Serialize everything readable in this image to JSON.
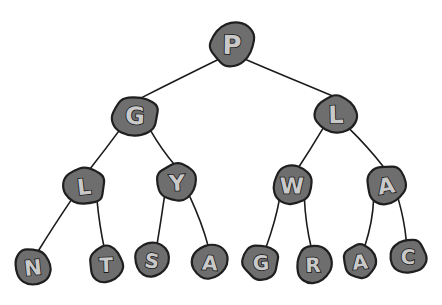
{
  "figure": {
    "title": "",
    "type": "binary-tree-diagram",
    "background_color": "#ffffff",
    "node_fill_color": "#6e6e6e",
    "node_outline_color": "#1f1f1f",
    "label_fill_color": "#c9c9c9",
    "label_outline_color": "#141414",
    "edge_color": "#1c1c1c",
    "width": 442,
    "height": 305
  },
  "tree": {
    "root": "P",
    "levels": 4,
    "node_count": 15,
    "nodes": [
      {
        "id": "n0",
        "label": "P",
        "level": 0,
        "x": 232,
        "y": 44,
        "rx": 23,
        "ry": 22,
        "font_size": 26,
        "shape": "blob-a"
      },
      {
        "id": "n1",
        "label": "G",
        "level": 1,
        "x": 135,
        "y": 115,
        "rx": 24,
        "ry": 20,
        "font_size": 24,
        "shape": "blob-b"
      },
      {
        "id": "n2",
        "label": "L",
        "level": 1,
        "x": 336,
        "y": 114,
        "rx": 21,
        "ry": 20,
        "font_size": 24,
        "shape": "blob-c"
      },
      {
        "id": "n3",
        "label": "L",
        "level": 2,
        "x": 84,
        "y": 186,
        "rx": 21,
        "ry": 20,
        "font_size": 22,
        "shape": "blob-d"
      },
      {
        "id": "n4",
        "label": "Y",
        "level": 2,
        "x": 177,
        "y": 182,
        "rx": 20,
        "ry": 19,
        "font_size": 22,
        "shape": "blob-a"
      },
      {
        "id": "n5",
        "label": "W",
        "level": 2,
        "x": 292,
        "y": 185,
        "rx": 20,
        "ry": 19,
        "font_size": 22,
        "shape": "blob-b"
      },
      {
        "id": "n6",
        "label": "A",
        "level": 2,
        "x": 386,
        "y": 185,
        "rx": 20,
        "ry": 20,
        "font_size": 22,
        "shape": "blob-c"
      },
      {
        "id": "n7",
        "label": "N",
        "level": 3,
        "x": 33,
        "y": 267,
        "rx": 19,
        "ry": 19,
        "font_size": 21,
        "shape": "blob-d"
      },
      {
        "id": "n8",
        "label": "T",
        "level": 3,
        "x": 106,
        "y": 264,
        "rx": 17,
        "ry": 18,
        "font_size": 20,
        "shape": "blob-a"
      },
      {
        "id": "n9",
        "label": "S",
        "level": 3,
        "x": 152,
        "y": 260,
        "rx": 17,
        "ry": 18,
        "font_size": 20,
        "shape": "blob-b"
      },
      {
        "id": "n10",
        "label": "A",
        "level": 3,
        "x": 210,
        "y": 262,
        "rx": 18,
        "ry": 18,
        "font_size": 20,
        "shape": "blob-c"
      },
      {
        "id": "n11",
        "label": "G",
        "level": 3,
        "x": 261,
        "y": 262,
        "rx": 18,
        "ry": 18,
        "font_size": 20,
        "shape": "blob-d"
      },
      {
        "id": "n12",
        "label": "R",
        "level": 3,
        "x": 313,
        "y": 264,
        "rx": 18,
        "ry": 19,
        "font_size": 20,
        "shape": "blob-a"
      },
      {
        "id": "n13",
        "label": "A",
        "level": 3,
        "x": 360,
        "y": 261,
        "rx": 17,
        "ry": 18,
        "font_size": 20,
        "shape": "blob-b"
      },
      {
        "id": "n14",
        "label": "C",
        "level": 3,
        "x": 408,
        "y": 256,
        "rx": 18,
        "ry": 18,
        "font_size": 20,
        "shape": "blob-c"
      }
    ],
    "edges": [
      {
        "from": "n0",
        "to": "n1",
        "side": "left"
      },
      {
        "from": "n0",
        "to": "n2",
        "side": "right"
      },
      {
        "from": "n1",
        "to": "n3",
        "side": "left"
      },
      {
        "from": "n1",
        "to": "n4",
        "side": "right"
      },
      {
        "from": "n2",
        "to": "n5",
        "side": "left"
      },
      {
        "from": "n2",
        "to": "n6",
        "side": "right"
      },
      {
        "from": "n3",
        "to": "n7",
        "side": "left"
      },
      {
        "from": "n3",
        "to": "n8",
        "side": "right"
      },
      {
        "from": "n4",
        "to": "n9",
        "side": "left"
      },
      {
        "from": "n4",
        "to": "n10",
        "side": "right"
      },
      {
        "from": "n5",
        "to": "n11",
        "side": "left"
      },
      {
        "from": "n5",
        "to": "n12",
        "side": "right"
      },
      {
        "from": "n6",
        "to": "n13",
        "side": "left"
      },
      {
        "from": "n6",
        "to": "n14",
        "side": "right"
      }
    ]
  }
}
